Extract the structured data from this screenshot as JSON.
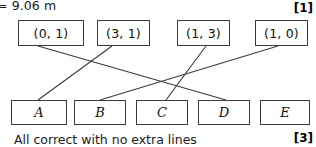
{
  "page": {
    "previous_answer_fragment": "= 9.06 m",
    "part_label": ")",
    "caption": "All correct with no extra lines"
  },
  "marks": {
    "top": "[1]",
    "bottom": "[3]"
  },
  "diagram": {
    "type": "matching",
    "top_nodes": [
      {
        "id": "coord1",
        "label": "(0, 1)",
        "x": 18,
        "y": 20,
        "w": 66
      },
      {
        "id": "coord2",
        "label": "(3, 1)",
        "x": 97,
        "y": 20,
        "w": 53
      },
      {
        "id": "coord3",
        "label": "(1, 3)",
        "x": 177,
        "y": 20,
        "w": 53
      },
      {
        "id": "coord4",
        "label": "(1, 0)",
        "x": 255,
        "y": 20,
        "w": 53
      }
    ],
    "bottom_nodes": [
      {
        "id": "A",
        "label": "A",
        "x": 11,
        "y": 100,
        "w": 56
      },
      {
        "id": "B",
        "label": "B",
        "x": 74,
        "y": 100,
        "w": 52
      },
      {
        "id": "C",
        "label": "C",
        "x": 136,
        "y": 100,
        "w": 52
      },
      {
        "id": "D",
        "label": "D",
        "x": 198,
        "y": 100,
        "w": 52
      },
      {
        "id": "E",
        "label": "E",
        "x": 260,
        "y": 100,
        "w": 50
      }
    ],
    "links": [
      {
        "from": "coord1",
        "to": "D",
        "x1": 38,
        "y1": 46,
        "x2": 226,
        "y2": 100
      },
      {
        "from": "coord2",
        "to": "A",
        "x1": 112,
        "y1": 46,
        "x2": 38,
        "y2": 100
      },
      {
        "from": "coord3",
        "to": "C",
        "x1": 206,
        "y1": 46,
        "x2": 166,
        "y2": 100
      },
      {
        "from": "coord4",
        "to": "B",
        "x1": 278,
        "y1": 46,
        "x2": 100,
        "y2": 100
      }
    ]
  }
}
